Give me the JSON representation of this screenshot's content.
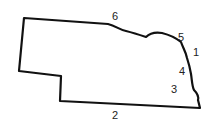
{
  "map": {
    "subject": "state outline",
    "outline_color": "#111111",
    "labels": [
      {
        "text": "6",
        "x": 112,
        "y": 11
      },
      {
        "text": "5",
        "x": 178,
        "y": 32
      },
      {
        "text": "1",
        "x": 193,
        "y": 47
      },
      {
        "text": "4",
        "x": 179,
        "y": 66
      },
      {
        "text": "3",
        "x": 171,
        "y": 84
      },
      {
        "text": "2",
        "x": 112,
        "y": 110
      }
    ]
  }
}
